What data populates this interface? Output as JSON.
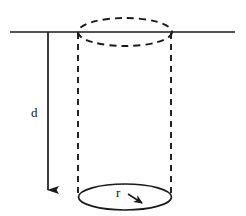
{
  "figure": {
    "kind": "geometry-diagram",
    "background_color": "#ffffff",
    "stroke_color": "#1a1a1a",
    "labels": {
      "depth": "d",
      "radius": "r"
    },
    "elements": {
      "ground_line_name": "ground-line",
      "top_ellipse_name": "cylinder-top-ellipse",
      "bottom_ellipse_name": "cylinder-bottom-ellipse",
      "left_side_name": "cylinder-left-edge",
      "right_side_name": "cylinder-right-edge",
      "depth_arrow_name": "depth-arrow",
      "radius_arrow_name": "radius-arrow"
    },
    "geometry": {
      "ground_line": {
        "x1": 10,
        "y1": 32,
        "x2": 235,
        "y2": 32
      },
      "top_ellipse": {
        "cx": 125,
        "cy": 32,
        "rx": 47,
        "ry": 14,
        "style": "dashed"
      },
      "bottom_ellipse": {
        "cx": 125,
        "cy": 197,
        "rx": 46.5,
        "ry": 13,
        "style": "solid"
      },
      "left_edge": {
        "x": 78,
        "y1": 32,
        "y2": 196,
        "style": "dashed"
      },
      "right_edge": {
        "x": 171,
        "y1": 32,
        "y2": 196,
        "style": "dashed"
      },
      "depth_arrow": {
        "x": 48,
        "y1": 32,
        "y2": 198
      },
      "radius_arrow": {
        "x1": 127,
        "y1": 194,
        "x2": 147,
        "y2": 206
      },
      "depth_label_pos": {
        "x": 31,
        "y": 117
      },
      "radius_label_pos": {
        "x": 116,
        "y": 197
      }
    }
  }
}
